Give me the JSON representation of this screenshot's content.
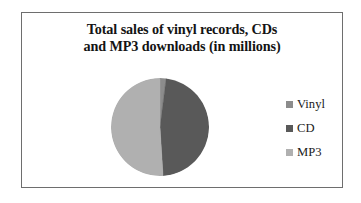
{
  "chart_data": {
    "type": "pie",
    "title": "Total sales of vinyl records, CDs and MP3 downloads (in millions)",
    "title_lines": [
      "Total sales of vinyl records, CDs",
      "and MP3 downloads (in millions)"
    ],
    "categories": [
      "Vinyl",
      "CD",
      "MP3"
    ],
    "values": [
      2,
      47,
      51
    ],
    "unit": "millions",
    "start_angle_deg": 0,
    "direction": "clockwise",
    "legend_position": "right",
    "grid": false,
    "colors": [
      "#8c8c8c",
      "#595959",
      "#b0b0b0"
    ],
    "slices": [
      {
        "label": "Vinyl",
        "value": 2,
        "percent": 2,
        "sweep_deg": 8,
        "color": "#8c8c8c"
      },
      {
        "label": "CD",
        "value": 47,
        "percent": 47,
        "sweep_deg": 170,
        "color": "#595959"
      },
      {
        "label": "MP3",
        "value": 51,
        "percent": 51,
        "sweep_deg": 182,
        "color": "#b0b0b0"
      }
    ]
  },
  "legend": {
    "items": [
      {
        "label": "Vinyl",
        "color": "#8c8c8c"
      },
      {
        "label": "CD",
        "color": "#595959"
      },
      {
        "label": "MP3",
        "color": "#b0b0b0"
      }
    ]
  },
  "frame": {
    "border_color": "#6e6e6e",
    "background": "#ffffff"
  }
}
